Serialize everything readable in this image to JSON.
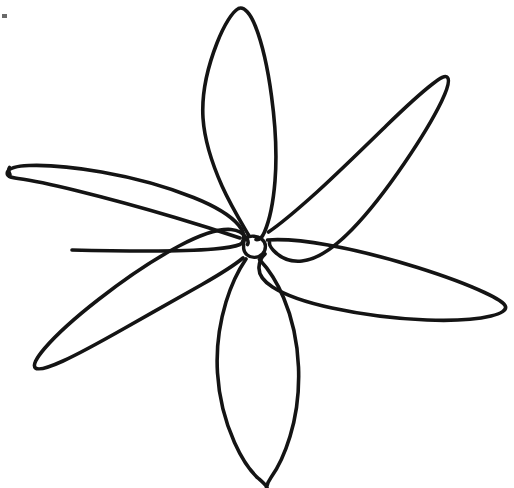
{
  "document": {
    "title": "Flower Line Drawing",
    "medium": "hand-drawn ink outline",
    "background_color": "#ffffff",
    "ink_color": "#141414",
    "canvas_width": 514,
    "canvas_height": 488,
    "description": "Six-petal star-shaped flower outline drawn in black ink on white paper"
  },
  "drawing": {
    "center": {
      "label": "flower-center",
      "cx": 254,
      "cy": 247,
      "rx": 11,
      "ry": 10,
      "stroke_width": 3.4,
      "path": "M 243.6 244.2 C 243.2 238.8 248.0 235.8 253.6 236.2 C 259.8 236.6 265.2 240.2 265.4 246.0 C 265.6 252.2 261.0 257.2 254.6 257.4 C 248.4 257.6 244.0 253.4 243.6 248.2 Z"
    },
    "petal_count": 6,
    "petals": [
      {
        "id": "petal-top",
        "label": "top petal",
        "tip_x": 240,
        "tip_y": 8,
        "base_x": 252,
        "base_y": 236,
        "stroke_width": 3.6,
        "path": "M 248.5 235.0 C 243.0 225.5 231.0 206.0 222.0 186.0 C 212.0 163.5 204.5 140.0 203.0 118.0 C 201.5 94.0 208.0 66.0 217.0 43.0 C 224.0 25.0 232.5 11.5 238.5 8.5 C 244.0 6.0 250.5 13.5 255.5 26.5 C 262.5 44.5 268.0 70.0 271.5 96.0 C 275.5 125.5 277.0 156.0 275.0 181.0 C 273.2 203.5 269.0 221.5 264.5 232.0 C 262.0 238.0 259.0 240.0 256.0 239.5"
      },
      {
        "id": "petal-upper-right",
        "label": "upper right petal",
        "tip_x": 445,
        "tip_y": 76,
        "base_x": 270,
        "base_y": 244,
        "stroke_width": 3.6,
        "path": "M 268.5 232.0 C 279.0 225.0 297.0 210.0 317.0 192.0 C 340.0 171.0 364.5 147.0 386.0 126.0 C 404.5 108.0 421.5 92.5 432.5 84.0 C 440.5 77.8 445.5 75.0 447.5 77.5 C 450.0 80.5 447.5 89.0 441.5 101.5 C 433.0 119.0 419.5 141.0 404.5 163.0 C 387.5 188.0 369.0 212.0 352.0 229.5 C 333.5 248.5 317.0 259.5 302.0 261.0 C 290.0 262.2 280.0 257.5 273.5 250.5 C 270.5 247.2 269.2 244.5 269.5 242.5"
      },
      {
        "id": "petal-right",
        "label": "right petal",
        "tip_x": 505,
        "tip_y": 305,
        "base_x": 266,
        "base_y": 252,
        "stroke_width": 3.6,
        "path": "M 267.5 240.0 C 281.0 239.0 303.0 240.5 328.0 245.0 C 357.0 250.2 389.0 258.5 417.5 267.5 C 444.5 276.0 468.5 285.0 484.5 292.5 C 497.0 298.3 504.5 303.0 505.5 306.5 C 506.5 310.0 501.5 313.5 491.0 316.0 C 476.0 319.5 453.0 321.0 427.0 320.0 C 396.0 318.8 362.0 314.5 332.0 308.0 C 306.0 302.4 285.0 295.0 272.5 287.0 C 263.0 280.9 258.5 274.0 259.0 267.0 C 259.4 261.5 262.0 256.5 265.0 254.0"
      },
      {
        "id": "petal-bottom",
        "label": "bottom petal",
        "tip_x": 266,
        "tip_y": 486,
        "base_x": 252,
        "base_y": 258,
        "stroke_width": 3.6,
        "path": "M 246.0 259.0 C 239.5 268.5 231.5 284.0 226.0 302.0 C 219.5 323.5 216.0 349.0 217.5 373.0 C 219.0 397.5 225.5 422.5 234.5 442.5 C 242.0 459.2 250.5 471.5 258.5 478.5 C 262.5 482.0 265.5 484.5 267.0 487.5 M 259.5 259.5 C 267.0 267.5 276.5 281.0 283.5 297.5 C 292.0 317.5 297.5 342.5 298.5 367.0 C 299.5 392.0 296.0 417.0 290.0 436.5 C 284.5 454.5 277.5 468.5 271.0 477.5 C 268.5 481.0 267.0 484.5 266.5 487.5"
      },
      {
        "id": "petal-lower-left",
        "label": "lower left petal",
        "tip_x": 36,
        "tip_y": 366,
        "base_x": 240,
        "base_y": 256,
        "stroke_width": 3.6,
        "path": "M 243.0 258.0 C 234.0 265.5 219.5 274.5 202.0 284.5 C 178.5 298.0 150.5 313.5 125.0 328.0 C 101.5 341.3 79.5 353.5 63.0 361.0 C 48.0 367.8 38.5 370.5 35.5 368.0 C 32.5 365.5 36.0 358.5 44.5 348.5 C 56.5 334.5 76.0 317.0 98.5 299.5 C 124.5 279.2 153.5 259.5 179.0 246.0 C 200.5 234.6 218.5 228.5 231.0 229.5 C 238.5 230.1 243.5 233.5 246.5 238.0 C 248.2 240.6 248.5 243.0 247.5 244.5"
      },
      {
        "id": "petal-left",
        "label": "left petal",
        "tip_x": 12,
        "tip_y": 168,
        "base_x": 238,
        "base_y": 244,
        "stroke_width": 3.6,
        "path": "M 240.0 238.0 C 225.0 233.0 202.0 225.5 175.0 217.5 C 143.0 208.0 106.5 198.0 76.0 190.5 C 51.0 184.3 29.5 180.0 18.0 178.5 C 10.0 177.5 6.0 176.0 7.5 172.0 C 9.0 168.0 16.5 166.0 29.0 165.5 C 47.0 164.8 73.0 167.0 101.5 172.0 C 134.0 177.7 167.5 187.0 193.5 197.5 C 215.0 206.1 230.5 215.5 238.5 225.0 C 243.0 230.4 244.5 235.5 243.5 239.5 C 242.8 242.4 241.5 244.0 239.5 244.5 M 10.0 174.5 C 8.5 171.5 8.0 169.5 9.5 167.5 M 240.0 244.5 C 235.0 246.5 226.0 248.0 214.0 249.0 C 196.0 250.5 172.0 251.0 148.0 251.0 C 120.0 251.0 92.0 250.5 72.0 250.0"
      }
    ],
    "artifacts": [
      {
        "id": "corner-speck",
        "label": "faint ink speck",
        "x": 2,
        "y": 14,
        "width": 5,
        "height": 4
      }
    ]
  }
}
